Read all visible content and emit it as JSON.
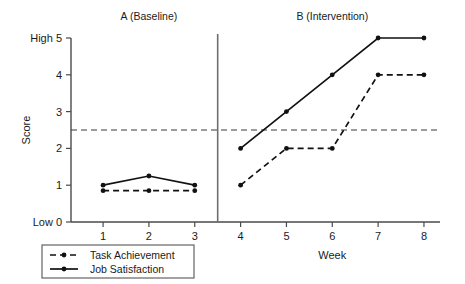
{
  "chart_data": {
    "type": "line",
    "title": "",
    "xlabel": "Week",
    "ylabel": "Score",
    "x": [
      1,
      2,
      3,
      4,
      5,
      6,
      7,
      8
    ],
    "xtick_labels": [
      "1",
      "2",
      "3",
      "4",
      "5",
      "6",
      "7",
      "8"
    ],
    "xlim": [
      0.3,
      8.35
    ],
    "ylim": [
      0,
      5
    ],
    "ytick_values": [
      0,
      1,
      2,
      3,
      4,
      5
    ],
    "ytick_labels": [
      "Low 0",
      "1",
      "2",
      "3",
      "4",
      "High 5"
    ],
    "grid": false,
    "legend_position": "bottom-left",
    "series": [
      {
        "name": "Task Achievement",
        "style": "dashed",
        "marker": "circle",
        "color": "#111111",
        "values": [
          0.85,
          0.85,
          0.85,
          1,
          2,
          2,
          4,
          4
        ]
      },
      {
        "name": "Job Satisfaction",
        "style": "solid",
        "marker": "circle",
        "color": "#111111",
        "values": [
          1,
          1.25,
          1,
          2,
          3,
          4,
          5,
          5
        ]
      }
    ],
    "phases": [
      {
        "label": "A (Baseline)",
        "x_range": [
          1,
          3
        ],
        "label_x": 2
      },
      {
        "label": "B (Intervention)",
        "x_range": [
          4,
          8
        ],
        "label_x": 6
      }
    ],
    "phase_divider": {
      "x": 3.5
    },
    "reference_line": {
      "y": 2.5,
      "style": "dashed",
      "label": ""
    },
    "break_between_phases": true
  },
  "legend": {
    "entries": [
      {
        "label": "Task Achievement",
        "style": "dashed"
      },
      {
        "label": "Job Satisfaction",
        "style": "solid"
      }
    ]
  },
  "axis": {
    "y_low_label": "Low 0",
    "y_high_label": "High 5",
    "y_title": "Score",
    "x_title": "Week"
  }
}
